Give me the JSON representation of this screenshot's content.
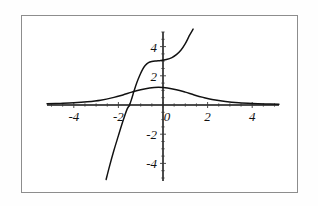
{
  "figure": {
    "background_color": "#ffffff",
    "frame_color": "#8d8d8d",
    "curve_color": "#111111",
    "axis_color": "#111111"
  },
  "chart_data": {
    "type": "line",
    "title": "",
    "subtitle": "",
    "xlabel": "",
    "ylabel": "",
    "xlim": [
      -5.2,
      5.2
    ],
    "ylim": [
      -5.2,
      5.2
    ],
    "grid": false,
    "legend": "none",
    "x_ticks": [
      -4,
      -2,
      0,
      2,
      4
    ],
    "x_tick_labels": [
      "-4",
      "-2",
      "0",
      "2",
      "4"
    ],
    "y_ticks": [
      -4,
      -2,
      2,
      4
    ],
    "y_tick_labels": [
      "-4",
      "-2",
      "2",
      "4"
    ],
    "y_zero_label": "0",
    "axes_position": "zero-crossing",
    "series": [
      {
        "name": "bell-curve",
        "description": "bell shaped curve peaking near x = -0.2 at y = 1.2, decaying toward zero on both sides",
        "x": [
          -5.2,
          -4.6,
          -4.0,
          -3.4,
          -2.8,
          -2.2,
          -1.8,
          -1.4,
          -1.0,
          -0.6,
          -0.2,
          0.2,
          0.6,
          1.0,
          1.4,
          1.8,
          2.2,
          2.8,
          3.4,
          4.0,
          4.6,
          5.2
        ],
        "y": [
          0.08,
          0.11,
          0.15,
          0.22,
          0.33,
          0.52,
          0.69,
          0.88,
          1.05,
          1.17,
          1.21,
          1.17,
          1.05,
          0.88,
          0.69,
          0.52,
          0.38,
          0.24,
          0.15,
          0.1,
          0.07,
          0.05
        ]
      },
      {
        "name": "steep-s-curve",
        "description": "steep rising S shaped curve crossing the x axis near x = -1.5, plateau near y = 3 between x = -0.7 and x = 0.4, then rising steeply again",
        "x": [
          -2.55,
          -2.4,
          -2.2,
          -2.0,
          -1.85,
          -1.72,
          -1.6,
          -1.5,
          -1.4,
          -1.3,
          -1.18,
          -1.05,
          -0.92,
          -0.8,
          -0.65,
          -0.5,
          -0.3,
          -0.1,
          0.15,
          0.4,
          0.6,
          0.8,
          1.0,
          1.2,
          1.35
        ],
        "y": [
          -5.1,
          -4.2,
          -3.1,
          -2.1,
          -1.35,
          -0.75,
          -0.25,
          0.0,
          0.45,
          0.95,
          1.5,
          2.0,
          2.42,
          2.7,
          2.9,
          2.98,
          3.02,
          3.05,
          3.12,
          3.25,
          3.45,
          3.75,
          4.2,
          4.8,
          5.2
        ]
      }
    ]
  }
}
